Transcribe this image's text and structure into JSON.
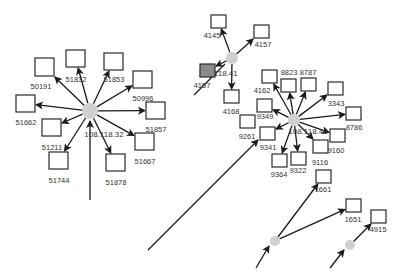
{
  "diagram": {
    "width": 398,
    "height": 275,
    "colors": {
      "hub_fill": "#d0d0d0",
      "box_stroke": "#2a2a2a",
      "box_fill": "#ffffff",
      "highlight_fill": "#8a8a8a",
      "edge": "#1a1a1a",
      "label": "#333333"
    },
    "hubs": [
      {
        "id": "h32",
        "label": "108.118.32",
        "x": 90,
        "y": 111,
        "r": 8,
        "lx": 104,
        "ly": 137
      },
      {
        "id": "h41",
        "label": "108.118.41",
        "x": 232,
        "y": 58,
        "r": 6,
        "lx": 218,
        "ly": 76
      },
      {
        "id": "h46",
        "label": "108.118.46",
        "x": 294,
        "y": 120,
        "r": 6,
        "lx": 308,
        "ly": 134
      },
      {
        "id": "hA",
        "label": "",
        "x": 275,
        "y": 241,
        "r": 5
      },
      {
        "id": "hB",
        "label": "",
        "x": 350,
        "y": 245,
        "r": 5
      }
    ],
    "nodes": [
      {
        "id": "50191",
        "label": "50191",
        "x": 35,
        "y": 58,
        "w": 19,
        "h": 18,
        "lx": 41,
        "ly": 89,
        "hub": "h32"
      },
      {
        "id": "51832",
        "label": "51832",
        "x": 66,
        "y": 50,
        "w": 19,
        "h": 17,
        "lx": 76,
        "ly": 82,
        "hub": "h32"
      },
      {
        "id": "51853",
        "label": "51853",
        "x": 104,
        "y": 53,
        "w": 19,
        "h": 17,
        "lx": 114,
        "ly": 82,
        "hub": "h32"
      },
      {
        "id": "50996",
        "label": "50996",
        "x": 133,
        "y": 71,
        "w": 19,
        "h": 17,
        "lx": 143,
        "ly": 101,
        "hub": "h32"
      },
      {
        "id": "51662",
        "label": "51662",
        "x": 16,
        "y": 95,
        "w": 19,
        "h": 17,
        "lx": 26,
        "ly": 125,
        "hub": "h32"
      },
      {
        "id": "51857",
        "label": "51857",
        "x": 146,
        "y": 102,
        "w": 19,
        "h": 17,
        "lx": 156,
        "ly": 132,
        "hub": "h32"
      },
      {
        "id": "51211",
        "label": "51211",
        "x": 42,
        "y": 119,
        "w": 19,
        "h": 17,
        "lx": 52,
        "ly": 150,
        "hub": "h32"
      },
      {
        "id": "51667",
        "label": "51667",
        "x": 135,
        "y": 133,
        "w": 19,
        "h": 17,
        "lx": 145,
        "ly": 164,
        "hub": "h32"
      },
      {
        "id": "51744",
        "label": "51744",
        "x": 49,
        "y": 152,
        "w": 19,
        "h": 17,
        "lx": 59,
        "ly": 183,
        "hub": "h32"
      },
      {
        "id": "51878",
        "label": "51878",
        "x": 106,
        "y": 154,
        "w": 19,
        "h": 17,
        "lx": 116,
        "ly": 185,
        "hub": "h32"
      },
      {
        "id": "4145",
        "label": "4145",
        "x": 211,
        "y": 15,
        "w": 15,
        "h": 13,
        "lx": 212,
        "ly": 38,
        "hub": "h41"
      },
      {
        "id": "4157a",
        "label": "4157",
        "x": 254,
        "y": 25,
        "w": 15,
        "h": 13,
        "lx": 263,
        "ly": 47,
        "hub": "h41"
      },
      {
        "id": "4157b",
        "label": "4157",
        "x": 200,
        "y": 64,
        "w": 15,
        "h": 13,
        "lx": 202,
        "ly": 88,
        "hub": "h41",
        "highlight": true
      },
      {
        "id": "4162",
        "label": "4162",
        "x": 262,
        "y": 70,
        "w": 15,
        "h": 13,
        "lx": 262,
        "ly": 93,
        "hub": "h46"
      },
      {
        "id": "4168",
        "label": "4168",
        "x": 224,
        "y": 90,
        "w": 15,
        "h": 13,
        "lx": 231,
        "ly": 114,
        "hub": "h41"
      },
      {
        "id": "8823",
        "label": "8823",
        "x": 281,
        "y": 79,
        "w": 15,
        "h": 13,
        "lx": 289,
        "ly": 75,
        "hub": "h46"
      },
      {
        "id": "8787",
        "label": "8787",
        "x": 301,
        "y": 78,
        "w": 15,
        "h": 13,
        "lx": 308,
        "ly": 75,
        "hub": "h46"
      },
      {
        "id": "3343",
        "label": "3343",
        "x": 328,
        "y": 82,
        "w": 15,
        "h": 13,
        "lx": 336,
        "ly": 106,
        "hub": "h46"
      },
      {
        "id": "9349",
        "label": "9349",
        "x": 257,
        "y": 99,
        "w": 15,
        "h": 13,
        "lx": 265,
        "ly": 119,
        "hub": "h46"
      },
      {
        "id": "8786",
        "label": "8786",
        "x": 346,
        "y": 107,
        "w": 15,
        "h": 13,
        "lx": 354,
        "ly": 130,
        "hub": "h46"
      },
      {
        "id": "9261",
        "label": "9261",
        "x": 240,
        "y": 115,
        "w": 15,
        "h": 13,
        "lx": 247,
        "ly": 139,
        "hub": null
      },
      {
        "id": "9341",
        "label": "9341",
        "x": 260,
        "y": 127,
        "w": 15,
        "h": 13,
        "lx": 268,
        "ly": 150,
        "hub": "h46"
      },
      {
        "id": "9160",
        "label": "9160",
        "x": 330,
        "y": 129,
        "w": 15,
        "h": 13,
        "lx": 336,
        "ly": 153,
        "hub": "h46"
      },
      {
        "id": "9364",
        "label": "9364",
        "x": 272,
        "y": 154,
        "w": 15,
        "h": 13,
        "lx": 279,
        "ly": 177,
        "hub": "h46"
      },
      {
        "id": "9322",
        "label": "9322",
        "x": 291,
        "y": 152,
        "w": 15,
        "h": 13,
        "lx": 298,
        "ly": 173,
        "hub": "h46"
      },
      {
        "id": "9116",
        "label": "9116",
        "x": 313,
        "y": 140,
        "w": 15,
        "h": 13,
        "lx": 320,
        "ly": 165,
        "hub": "h46"
      },
      {
        "id": "1661",
        "label": "1661",
        "x": 316,
        "y": 170,
        "w": 15,
        "h": 13,
        "lx": 323,
        "ly": 192,
        "hub": "hA"
      },
      {
        "id": "1651",
        "label": "1651",
        "x": 346,
        "y": 199,
        "w": 15,
        "h": 13,
        "lx": 353,
        "ly": 222,
        "hub": "hA"
      },
      {
        "id": "4915",
        "label": "4915",
        "x": 371,
        "y": 210,
        "w": 15,
        "h": 13,
        "lx": 378,
        "ly": 232,
        "hub": "hB"
      }
    ],
    "incoming_edges": [
      {
        "from": [
          90,
          200
        ],
        "to": [
          90,
          121
        ],
        "arrow": true
      },
      {
        "from": [
          194,
          95
        ],
        "to": [
          225,
          64
        ],
        "arrow": false
      },
      {
        "from": [
          148,
          250
        ],
        "to": [
          258,
          140
        ],
        "arrow": true
      },
      {
        "from": [
          256,
          268
        ],
        "to": [
          269,
          246
        ],
        "arrow": true
      },
      {
        "from": [
          330,
          268
        ],
        "to": [
          344,
          250
        ],
        "arrow": true
      }
    ]
  }
}
